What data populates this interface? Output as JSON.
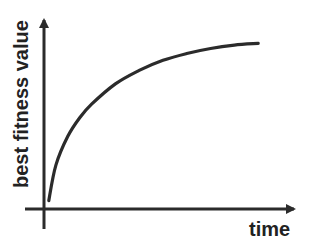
{
  "chart_data": {
    "type": "line",
    "title": "",
    "xlabel": "time",
    "ylabel": "best fitness value",
    "xlim": [
      0,
      1
    ],
    "ylim": [
      0,
      1
    ],
    "grid": false,
    "legend": "none",
    "ticks": {
      "x": [],
      "y": []
    },
    "series": [
      {
        "name": "best fitness",
        "description": "saturating growth curve",
        "x": [
          0.02,
          0.05,
          0.1,
          0.15,
          0.2,
          0.3,
          0.4,
          0.5,
          0.6,
          0.7,
          0.8,
          0.9
        ],
        "y": [
          0.05,
          0.26,
          0.43,
          0.54,
          0.62,
          0.74,
          0.82,
          0.88,
          0.92,
          0.95,
          0.97,
          0.98
        ]
      }
    ],
    "colors": {
      "line": "#2b2b2b",
      "axis": "#2b2b2b",
      "text": "#222222"
    }
  }
}
